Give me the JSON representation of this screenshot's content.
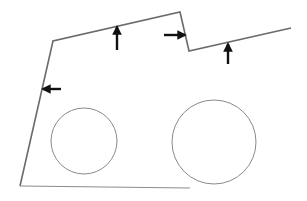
{
  "diagram": {
    "boundary": {
      "points": [
        [
          20,
          186
        ],
        [
          53,
          41
        ],
        [
          180,
          12
        ],
        [
          189,
          51
        ],
        [
          291,
          28
        ]
      ],
      "stroke": "#6b6b6b"
    },
    "base_line": {
      "points": [
        [
          20,
          186
        ],
        [
          190,
          188
        ]
      ],
      "stroke": "#8c8c8c"
    },
    "circles": [
      {
        "name": "left-circle",
        "cx": 84,
        "cy": 141,
        "r": 33,
        "stroke": "#8a8a8a",
        "label": "",
        "label_pos": [
          104,
          176
        ]
      },
      {
        "name": "right-circle",
        "cx": 214,
        "cy": 142,
        "r": 42,
        "stroke": "#8a8a8a",
        "label": "",
        "label_pos": [
          211,
          195
        ]
      }
    ],
    "base_label": {
      "text": "",
      "pos": [
        82,
        189
      ]
    },
    "arrows": [
      {
        "name": "arrow-up-top-left",
        "direction": "up",
        "x1": 117,
        "y1": 50,
        "x2": 117,
        "y2": 27
      },
      {
        "name": "arrow-right-notch",
        "direction": "right",
        "x1": 164,
        "y1": 35,
        "x2": 185,
        "y2": 35
      },
      {
        "name": "arrow-up-top-right",
        "direction": "up",
        "x1": 228,
        "y1": 64,
        "x2": 228,
        "y2": 44
      },
      {
        "name": "arrow-left-side",
        "direction": "left",
        "x1": 61,
        "y1": 89,
        "x2": 43,
        "y2": 89
      }
    ],
    "arrow_color": "#111111"
  }
}
